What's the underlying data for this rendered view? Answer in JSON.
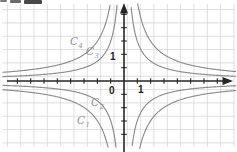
{
  "colors": {
    "background": "#ffffff",
    "grid": "#d7d7d7",
    "axis": "#262626",
    "curve": "#8c8c8c",
    "curve_label": "#949494",
    "tick_label": "#1f1f1f"
  },
  "chart_data": {
    "type": "line",
    "grid": true,
    "legend": false,
    "axes": {
      "origin_label": "0",
      "x_tick_label": "1",
      "y_tick_label": "1",
      "x_arrow": "right",
      "y_arrow": "up",
      "unit_per_grid_square": 1
    },
    "curves": [
      {
        "id": "C1",
        "label_base": "C",
        "label_sub": "1",
        "k": 2,
        "branches": [
          "Q1",
          "Q3"
        ],
        "labeled_in": "Q3-outer"
      },
      {
        "id": "C2",
        "label_base": "C",
        "label_sub": "2",
        "k": 1,
        "branches": [
          "Q1",
          "Q3"
        ],
        "labeled_in": "Q3-inner"
      },
      {
        "id": "C3",
        "label_base": "C",
        "label_sub": "3",
        "k": -1,
        "branches": [
          "Q2",
          "Q4"
        ],
        "labeled_in": "Q2-inner"
      },
      {
        "id": "C4",
        "label_base": "C",
        "label_sub": "4",
        "k": -2,
        "branches": [
          "Q2",
          "Q4"
        ],
        "labeled_in": "Q2-outer"
      }
    ],
    "artifact": "cropped dark text fragment along top-left edge"
  }
}
